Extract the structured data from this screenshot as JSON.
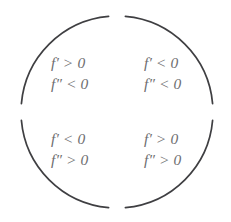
{
  "figure": {
    "name": "concavity-increasing-decreasing-circle",
    "background_color": "#ffffff",
    "arc_color": "#3f3f42",
    "text_color": "#6e6e70"
  },
  "circle": {
    "center_x": 117,
    "center_y": 112,
    "radius": 96,
    "stroke_width": 1.6,
    "gap_positions": [
      "top",
      "bottom",
      "left",
      "right"
    ]
  },
  "quadrants": {
    "top_left": {
      "name": "increasing-concave-down",
      "first_derivative": "f′ > 0",
      "second_derivative": "f″ < 0"
    },
    "top_right": {
      "name": "decreasing-concave-down",
      "first_derivative": "f′ < 0",
      "second_derivative": "f″ < 0"
    },
    "bottom_left": {
      "name": "decreasing-concave-up",
      "first_derivative": "f′ < 0",
      "second_derivative": "f″ > 0"
    },
    "bottom_right": {
      "name": "increasing-concave-up",
      "first_derivative": "f′ > 0",
      "second_derivative": "f″ > 0"
    }
  }
}
